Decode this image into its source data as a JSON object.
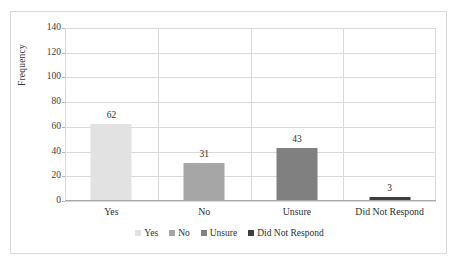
{
  "chart_data": {
    "type": "bar",
    "title": "",
    "xlabel": "",
    "ylabel": "Frequency",
    "categories": [
      "Yes",
      "No",
      "Unsure",
      "Did Not Respond"
    ],
    "values": [
      62,
      31,
      43,
      3
    ],
    "value_labels": [
      "62",
      "31",
      "43",
      "3"
    ],
    "ylim": [
      0,
      140
    ],
    "ytick_values": [
      0,
      20,
      40,
      60,
      80,
      100,
      120,
      140
    ],
    "ytick_labels": [
      "0",
      "20",
      "40",
      "60",
      "80",
      "100",
      "120",
      "140"
    ],
    "grid": {
      "horizontal": true,
      "vertical": true
    },
    "legend": {
      "position": "bottom",
      "entries": [
        {
          "label": "Yes",
          "color": "#e2e2e2"
        },
        {
          "label": "No",
          "color": "#a6a6a6"
        },
        {
          "label": "Unsure",
          "color": "#808080"
        },
        {
          "label": "Did Not Respond",
          "color": "#3f3f3f"
        }
      ]
    },
    "series": [
      {
        "name": "Frequency",
        "points": [
          {
            "category": "Yes",
            "value": 62,
            "color": "#e2e2e2"
          },
          {
            "category": "No",
            "value": 31,
            "color": "#a6a6a6"
          },
          {
            "category": "Unsure",
            "value": 43,
            "color": "#808080"
          },
          {
            "category": "Did Not Respond",
            "value": 3,
            "color": "#3f3f3f"
          }
        ]
      }
    ],
    "colors": {
      "grid": "#d9d9d9",
      "axis": "#aaaaaa",
      "frame": "#d9d9d9",
      "text": "#2e2e2e",
      "background": "#ffffff"
    }
  }
}
